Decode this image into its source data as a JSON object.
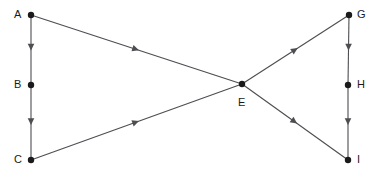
{
  "diagram": {
    "type": "directed-graph",
    "width": 381,
    "height": 177,
    "background_color": "#ffffff",
    "edge_color": "#4d4d52",
    "node_color": "#1a1a1a",
    "label_color": "#1a1a1a",
    "nodes": [
      {
        "id": "A",
        "label": "A",
        "x": 31,
        "y": 15,
        "label_x": 14,
        "label_y": 9
      },
      {
        "id": "B",
        "label": "B",
        "x": 31,
        "y": 85,
        "label_x": 14,
        "label_y": 79
      },
      {
        "id": "C",
        "label": "C",
        "x": 31,
        "y": 160,
        "label_x": 14,
        "label_y": 154
      },
      {
        "id": "E",
        "label": "E",
        "x": 242,
        "y": 84,
        "label_x": 238,
        "label_y": 97
      },
      {
        "id": "G",
        "label": "G",
        "x": 349,
        "y": 15,
        "label_x": 357,
        "label_y": 9
      },
      {
        "id": "H",
        "label": "H",
        "x": 348,
        "y": 85,
        "label_x": 357,
        "label_y": 79
      },
      {
        "id": "I",
        "label": "I",
        "x": 348,
        "y": 160,
        "label_x": 357,
        "label_y": 154
      }
    ],
    "edges": [
      {
        "id": "A-B",
        "from": "A",
        "to": "B",
        "arrow_t": 0.47
      },
      {
        "id": "B-C",
        "from": "B",
        "to": "C",
        "arrow_t": 0.5
      },
      {
        "id": "A-E",
        "from": "A",
        "to": "E",
        "arrow_t": 0.5
      },
      {
        "id": "C-E",
        "from": "C",
        "to": "E",
        "arrow_t": 0.5
      },
      {
        "id": "E-G",
        "from": "E",
        "to": "G",
        "arrow_t": 0.5
      },
      {
        "id": "E-I",
        "from": "E",
        "to": "I",
        "arrow_t": 0.5
      },
      {
        "id": "G-H",
        "from": "G",
        "to": "H",
        "arrow_t": 0.47
      },
      {
        "id": "H-I",
        "from": "H",
        "to": "I",
        "arrow_t": 0.5
      }
    ]
  }
}
